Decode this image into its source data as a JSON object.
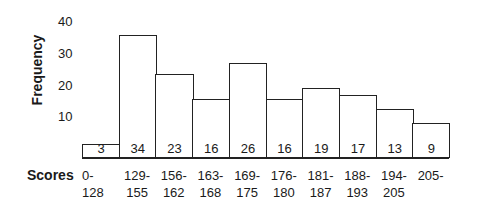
{
  "chart_data": {
    "type": "bar",
    "title": "",
    "xlabel": "Scores",
    "ylabel": "Frequency",
    "yticks": [
      10,
      20,
      30,
      40
    ],
    "ylim": [
      0,
      40
    ],
    "grid": false,
    "legend": null,
    "categories": [
      "0-\n128",
      "129-\n155",
      "156-\n162",
      "163-\n168",
      "169-\n175",
      "176-\n180",
      "181-\n187",
      "188-\n193",
      "194-\n205",
      "205-"
    ],
    "values": [
      3,
      34,
      23,
      16,
      26,
      16,
      19,
      17,
      13,
      9
    ],
    "data_labels": [
      "3",
      "34",
      "23",
      "16",
      "26",
      "16",
      "19",
      "17",
      "13",
      "9"
    ]
  },
  "axis": {
    "y_title": "Frequency",
    "x_title": "Scores",
    "y_ticks": [
      "40",
      "30",
      "20",
      "10"
    ]
  },
  "bins": [
    {
      "label": "0-\n128",
      "value": "3"
    },
    {
      "label": "129-\n155",
      "value": "34"
    },
    {
      "label": "156-\n162",
      "value": "23"
    },
    {
      "label": "163-\n168",
      "value": "16"
    },
    {
      "label": "169-\n175",
      "value": "26"
    },
    {
      "label": "176-\n180",
      "value": "16"
    },
    {
      "label": "181-\n187",
      "value": "19"
    },
    {
      "label": "188-\n193",
      "value": "17"
    },
    {
      "label": "194-\n205",
      "value": "13"
    },
    {
      "label": "205-",
      "value": "9"
    }
  ]
}
